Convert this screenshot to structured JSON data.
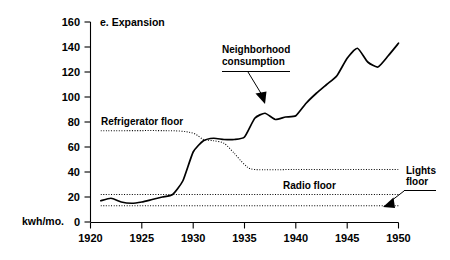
{
  "chart_data": {
    "type": "line",
    "title": "e. Expansion",
    "xlabel": "",
    "ylabel": "kwh/mo.",
    "xlim": [
      1920,
      1950
    ],
    "ylim": [
      0,
      160
    ],
    "grid": false,
    "legend_position": "none",
    "x_ticks": [
      1920,
      1925,
      1930,
      1935,
      1940,
      1945,
      1950
    ],
    "y_ticks": [
      0,
      20,
      40,
      60,
      80,
      100,
      120,
      140,
      160
    ],
    "series": [
      {
        "name": "Neighborhood consumption",
        "style": "solid",
        "x": [
          1921,
          1922,
          1923,
          1924,
          1925,
          1926,
          1927,
          1928,
          1929,
          1930,
          1931,
          1932,
          1933,
          1934,
          1935,
          1936,
          1937,
          1938,
          1939,
          1940,
          1941,
          1942,
          1943,
          1944,
          1945,
          1946,
          1947,
          1948,
          1949,
          1950
        ],
        "values": [
          17,
          19,
          16,
          15,
          16,
          18,
          20,
          22,
          33,
          56,
          65,
          67,
          66,
          66,
          68,
          83,
          87,
          82,
          84,
          85,
          95,
          103,
          110,
          117,
          131,
          139,
          128,
          124,
          133,
          143
        ]
      },
      {
        "name": "Refrigerator floor",
        "style": "dotted",
        "x": [
          1921,
          1928,
          1930,
          1931,
          1932,
          1933,
          1934,
          1935,
          1936,
          1940,
          1945,
          1950
        ],
        "values": [
          73,
          73,
          71,
          66,
          65,
          63,
          55,
          46,
          42,
          42,
          42,
          42
        ]
      },
      {
        "name": "Radio floor",
        "style": "dotted",
        "x": [
          1921,
          1950
        ],
        "values": [
          22,
          22
        ]
      },
      {
        "name": "Lights floor",
        "style": "dotted",
        "x": [
          1921,
          1950
        ],
        "values": [
          13,
          13
        ]
      }
    ],
    "annotations": [
      {
        "text": "Refrigerator floor",
        "target_series": "Refrigerator floor"
      },
      {
        "text": "Neighborhood consumption",
        "target_series": "Neighborhood consumption"
      },
      {
        "text": "Radio floor",
        "target_series": "Radio floor"
      },
      {
        "text": "Lights floor",
        "target_series": "Lights floor"
      }
    ]
  },
  "labels": {
    "title": "e. Expansion",
    "y_axis_unit": "kwh/mo.",
    "refrigerator_floor": "Refrigerator floor",
    "neighborhood_line1": "Neighborhood",
    "neighborhood_line2": "consumption",
    "radio_floor": "Radio floor",
    "lights_floor_line1": "Lights",
    "lights_floor_line2": "floor",
    "y_ticks": [
      "160",
      "140",
      "120",
      "100",
      "80",
      "60",
      "40",
      "20",
      "0"
    ],
    "x_ticks": [
      "1920",
      "1925",
      "1930",
      "1935",
      "1940",
      "1945",
      "1950"
    ]
  },
  "colors": {
    "ink": "#000000",
    "background": "#ffffff"
  }
}
